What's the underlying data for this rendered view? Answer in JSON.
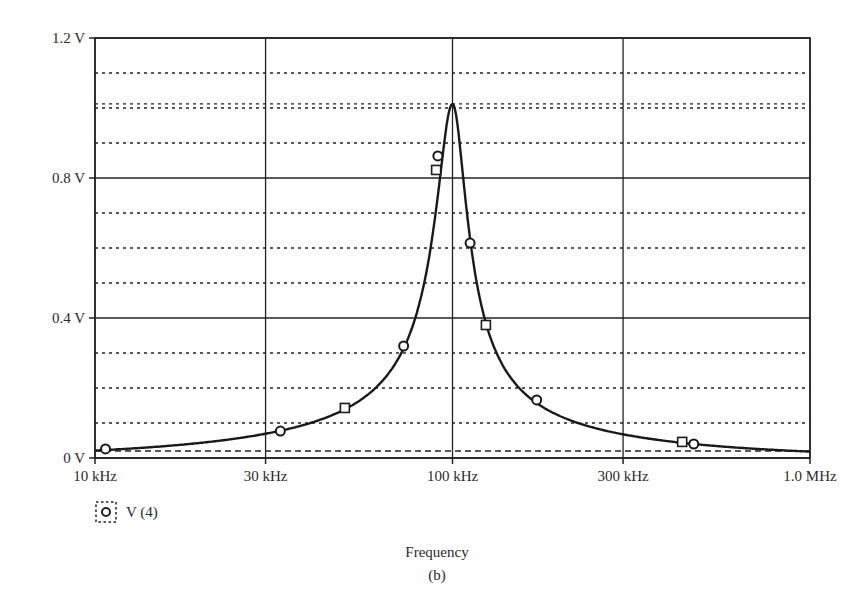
{
  "chart_data": {
    "type": "line",
    "title": "",
    "subtitle": "(b)",
    "xlabel": "Frequency",
    "ylabel": "",
    "xscale": "log",
    "xlim": [
      10000,
      1000000
    ],
    "ylim": [
      0,
      1.2
    ],
    "x_major_ticks": [
      {
        "value": 10000,
        "label": "10 kHz"
      },
      {
        "value": 30000,
        "label": "30 kHz"
      },
      {
        "value": 100000,
        "label": "100 kHz"
      },
      {
        "value": 300000,
        "label": "300 kHz"
      },
      {
        "value": 1000000,
        "label": "1.0 MHz"
      }
    ],
    "y_major_ticks": [
      {
        "value": 0,
        "label": "0 V"
      },
      {
        "value": 0.4,
        "label": "0.4 V"
      },
      {
        "value": 0.8,
        "label": "0.8 V"
      },
      {
        "value": 1.2,
        "label": "1.2 V"
      }
    ],
    "y_dashed_gridlines": [
      0.02,
      0.1,
      0.2,
      0.3,
      0.5,
      0.6,
      0.7,
      0.9,
      1.0,
      1.012,
      1.1
    ],
    "grid": true,
    "legend": {
      "position": "bottom-left",
      "entries": [
        {
          "marker": "circle",
          "label": "V (4)"
        }
      ]
    },
    "series": [
      {
        "name": "V (4)",
        "resonant_frequency_hz": 100000,
        "peak_value_v": 1.012,
        "x": [
          10000,
          15000,
          20000,
          30000,
          40000,
          50000,
          60000,
          70000,
          75000,
          80000,
          85000,
          90000,
          94000,
          97000,
          100000,
          103000,
          106000,
          110000,
          115000,
          120000,
          130000,
          150000,
          175000,
          200000,
          250000,
          300000,
          400000,
          500000,
          700000,
          1000000
        ],
        "values": [
          0.021,
          0.032,
          0.043,
          0.066,
          0.092,
          0.14,
          0.19,
          0.27,
          0.33,
          0.42,
          0.55,
          0.76,
          0.9,
          0.98,
          1.012,
          0.97,
          0.88,
          0.66,
          0.5,
          0.4,
          0.3,
          0.22,
          0.165,
          0.13,
          0.093,
          0.07,
          0.047,
          0.04,
          0.027,
          0.014
        ]
      }
    ],
    "markers": [
      {
        "shape": "circle",
        "x": 10700,
        "y": 0.026
      },
      {
        "shape": "circle",
        "x": 33000,
        "y": 0.077
      },
      {
        "shape": "square",
        "x": 50000,
        "y": 0.143
      },
      {
        "shape": "circle",
        "x": 73000,
        "y": 0.32
      },
      {
        "shape": "square",
        "x": 90000,
        "y": 0.823
      },
      {
        "shape": "circle",
        "x": 91000,
        "y": 0.863
      },
      {
        "shape": "circle",
        "x": 112000,
        "y": 0.614
      },
      {
        "shape": "square",
        "x": 124000,
        "y": 0.38
      },
      {
        "shape": "circle",
        "x": 172000,
        "y": 0.166
      },
      {
        "shape": "square",
        "x": 439000,
        "y": 0.046
      },
      {
        "shape": "circle",
        "x": 473000,
        "y": 0.04
      }
    ]
  },
  "legend": {
    "label": "V (4)"
  },
  "axis": {
    "x_title": "Frequency",
    "caption": "(b)"
  }
}
